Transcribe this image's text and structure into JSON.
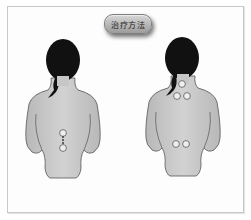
{
  "title": {
    "label": "治疗方法"
  },
  "figures": [
    {
      "name": "left-figure",
      "view": "back",
      "acupoints": [
        "lower-back-upper",
        "lower-back-lower"
      ]
    },
    {
      "name": "right-figure",
      "view": "back",
      "acupoints": [
        "neck",
        "upper-back-left",
        "upper-back-right",
        "lower-back-left",
        "lower-back-right"
      ]
    }
  ],
  "colors": {
    "skin": "#c9c9c9",
    "hair": "#111111",
    "point_fill": "#eeeeee",
    "outline": "#555555"
  }
}
